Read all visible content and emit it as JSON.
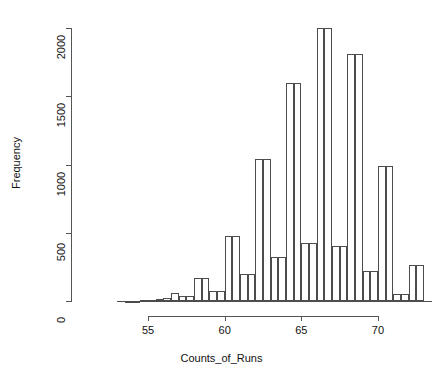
{
  "chart_data": {
    "type": "bar",
    "subtype": "histogram",
    "title": "",
    "xlabel": "Counts_of_Runs",
    "ylabel": "Frequency",
    "xlim": [
      53.0,
      73.5
    ],
    "ylim": [
      0,
      2070
    ],
    "grid": false,
    "legend": null,
    "bin_width": 0.5,
    "xticks": [
      55,
      60,
      65,
      70
    ],
    "xtick_labels": [
      "55",
      "60",
      "65",
      "70"
    ],
    "yticks": [
      0,
      500,
      1000,
      1500,
      2000
    ],
    "ytick_labels": [
      "0",
      "500",
      "1000",
      "1500",
      "2000"
    ],
    "bins": [
      {
        "x0": 53.5,
        "x1": 54.0,
        "value": 2
      },
      {
        "x0": 54.0,
        "x1": 54.5,
        "value": 3
      },
      {
        "x0": 54.5,
        "x1": 55.0,
        "value": 5
      },
      {
        "x0": 55.0,
        "x1": 55.5,
        "value": 8
      },
      {
        "x0": 55.5,
        "x1": 56.0,
        "value": 12
      },
      {
        "x0": 56.0,
        "x1": 56.5,
        "value": 20
      },
      {
        "x0": 56.5,
        "x1": 57.0,
        "value": 55
      },
      {
        "x0": 57.0,
        "x1": 57.5,
        "value": 40
      },
      {
        "x0": 57.5,
        "x1": 58.0,
        "value": 40
      },
      {
        "x0": 58.0,
        "x1": 58.5,
        "value": 165
      },
      {
        "x0": 58.5,
        "x1": 59.0,
        "value": 165
      },
      {
        "x0": 59.0,
        "x1": 59.5,
        "value": 72
      },
      {
        "x0": 59.5,
        "x1": 60.0,
        "value": 72
      },
      {
        "x0": 60.0,
        "x1": 60.5,
        "value": 475
      },
      {
        "x0": 60.5,
        "x1": 61.0,
        "value": 475
      },
      {
        "x0": 61.0,
        "x1": 61.5,
        "value": 200
      },
      {
        "x0": 61.5,
        "x1": 62.0,
        "value": 200
      },
      {
        "x0": 62.0,
        "x1": 62.5,
        "value": 1040
      },
      {
        "x0": 62.5,
        "x1": 63.0,
        "value": 1040
      },
      {
        "x0": 63.0,
        "x1": 63.5,
        "value": 320
      },
      {
        "x0": 63.5,
        "x1": 64.0,
        "value": 320
      },
      {
        "x0": 64.0,
        "x1": 64.5,
        "value": 1595
      },
      {
        "x0": 64.5,
        "x1": 65.0,
        "value": 1595
      },
      {
        "x0": 65.0,
        "x1": 65.5,
        "value": 425
      },
      {
        "x0": 65.5,
        "x1": 66.0,
        "value": 425
      },
      {
        "x0": 66.0,
        "x1": 66.5,
        "value": 2000
      },
      {
        "x0": 66.5,
        "x1": 67.0,
        "value": 2000
      },
      {
        "x0": 67.0,
        "x1": 67.5,
        "value": 405
      },
      {
        "x0": 67.5,
        "x1": 68.0,
        "value": 405
      },
      {
        "x0": 68.0,
        "x1": 68.5,
        "value": 1810
      },
      {
        "x0": 68.5,
        "x1": 69.0,
        "value": 1810
      },
      {
        "x0": 69.0,
        "x1": 69.5,
        "value": 220
      },
      {
        "x0": 69.5,
        "x1": 70.0,
        "value": 220
      },
      {
        "x0": 70.0,
        "x1": 70.5,
        "value": 990
      },
      {
        "x0": 70.5,
        "x1": 71.0,
        "value": 990
      },
      {
        "x0": 71.0,
        "x1": 71.5,
        "value": 50
      },
      {
        "x0": 71.5,
        "x1": 72.0,
        "value": 50
      },
      {
        "x0": 72.0,
        "x1": 72.5,
        "value": 265
      },
      {
        "x0": 72.5,
        "x1": 73.0,
        "value": 265
      }
    ],
    "colors": {
      "bar_fill": "#ffffff",
      "bar_stroke": "#4c4c4c",
      "axis": "#555555",
      "text": "#111111",
      "background": "#ffffff"
    }
  },
  "geometry": {
    "plot_left": 71,
    "plot_right": 440,
    "y_zero_px": 301,
    "y_top_px": 28,
    "y_top_value": 2000,
    "x_at_55_px": 148,
    "px_per_unit_x": 15.33,
    "axis_left_x": 71,
    "xaxis_y": 316,
    "xaxis_x_start": 148,
    "xaxis_x_end": 378
  }
}
